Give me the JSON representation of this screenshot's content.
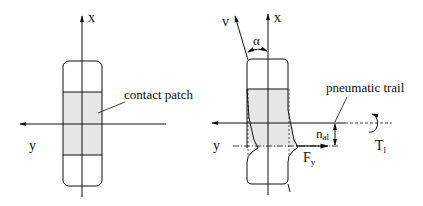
{
  "figure": {
    "left": {
      "axis_x_label": "x",
      "axis_y_label": "y",
      "callout_label": "contact patch"
    },
    "right": {
      "axis_x_label": "x",
      "axis_y_label": "y",
      "velocity_label": "v",
      "slip_angle_label": "α",
      "callout_label": "pneumatic trail",
      "trail_label_main": "n",
      "trail_label_sub": "al",
      "force_label_main": "F",
      "force_label_sub": "y",
      "torque_label_main": "T",
      "torque_label_sub": "l"
    },
    "colors": {
      "line": "#111111",
      "patch_fill": "#e6e6e6"
    }
  }
}
